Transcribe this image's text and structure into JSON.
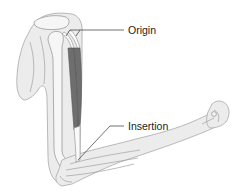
{
  "diagram": {
    "labels": {
      "origin": "Origin",
      "insertion": "Insertion"
    }
  }
}
